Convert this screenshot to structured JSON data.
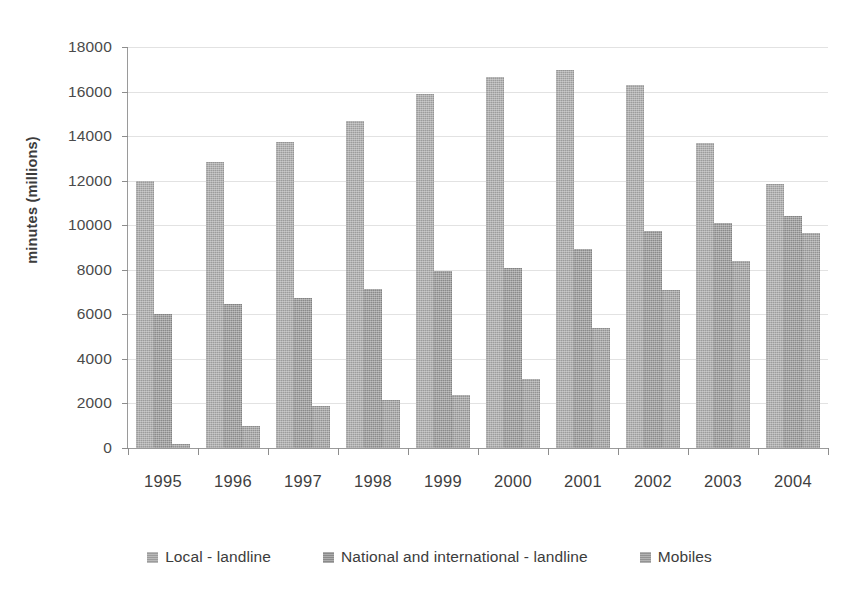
{
  "chart_data": {
    "type": "bar",
    "title": "",
    "xlabel": "",
    "ylabel": "minutes (millions)",
    "categories": [
      "1995",
      "1996",
      "1997",
      "1998",
      "1999",
      "2000",
      "2001",
      "2002",
      "2003",
      "2004"
    ],
    "series": [
      {
        "name": "Local - landline",
        "color": "#9c9c9c",
        "values": [
          12000,
          12850,
          13750,
          14700,
          15900,
          16650,
          16950,
          16300,
          13700,
          11850
        ]
      },
      {
        "name": "National and international - landline",
        "color": "#8a8a8a",
        "values": [
          6000,
          6450,
          6750,
          7150,
          7950,
          8100,
          8950,
          9750,
          10100,
          10400
        ]
      },
      {
        "name": "Mobiles",
        "color": "#939393",
        "values": [
          200,
          1000,
          1900,
          2150,
          2400,
          3100,
          5400,
          7100,
          8400,
          9650
        ]
      }
    ],
    "ylim": [
      0,
      18000
    ],
    "ytick_step": 2000,
    "yticks": [
      0,
      2000,
      4000,
      6000,
      8000,
      10000,
      12000,
      14000,
      16000,
      18000
    ],
    "ytick_labels": [
      "0",
      "2000",
      "4000",
      "6000",
      "8000",
      "10000",
      "12000",
      "14000",
      "16000",
      "18000"
    ],
    "grid": true,
    "legend_position": "bottom"
  },
  "legend": {
    "items": [
      {
        "label": "Local - landline"
      },
      {
        "label": "National and international - landline"
      },
      {
        "label": "Mobiles"
      }
    ]
  }
}
